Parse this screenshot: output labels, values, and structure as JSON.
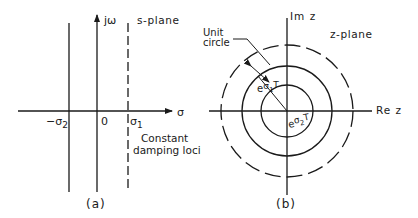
{
  "panel_a": {
    "caption": "(a)",
    "plane_label": "s-plane",
    "imag_axis_label": "jω",
    "real_axis_label": "σ",
    "origin_label": "0",
    "neg_sigma2_label": "−σ",
    "neg_sigma2_sub": "2",
    "sigma1_label": "σ",
    "sigma1_sub": "1",
    "loci_label_line1": "Constant",
    "loci_label_line2": "damping loci"
  },
  "panel_b": {
    "caption": "(b)",
    "plane_label": "z-plane",
    "imag_axis_label": "Im z",
    "real_axis_label": "Re z",
    "unit_circle_line1": "Unit",
    "unit_circle_line2": "circle",
    "radius1_base": "e",
    "radius1_exp": "σ",
    "radius1_exp_sub": "1",
    "radius1_exp_T": "T",
    "radius2_base": "e",
    "radius2_exp": "σ",
    "radius2_exp_sub": "2",
    "radius2_exp_T": "T"
  },
  "colors": {
    "line": "#1a1a1a",
    "background": "#ffffff"
  }
}
